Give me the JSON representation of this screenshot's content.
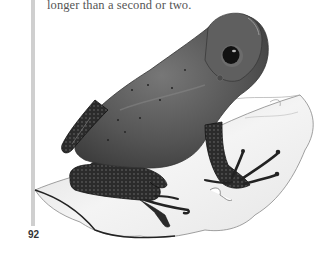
{
  "page": {
    "text_fragment": "longer than a second or two.",
    "page_number": "92"
  },
  "illustration": {
    "subject": "frog-on-leaf",
    "colors": {
      "body": "#5a5a5a",
      "leg": "#2a2a2a",
      "leaf": "#f2f2f2",
      "margin_bar": "#cfcfcf"
    }
  }
}
